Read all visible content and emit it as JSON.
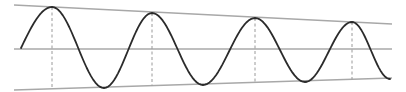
{
  "diagram": {
    "type": "damped-oscillation",
    "colors": {
      "background": "#ffffff",
      "wave": "#2b2b2b",
      "envelope": "#a8a8a8",
      "axis": "#a8a8a8",
      "peak_marker": "#9a9a9a"
    },
    "envelope_top": {
      "x1": 14,
      "y1": 5,
      "x2": 392,
      "y2": 24
    },
    "envelope_bottom": {
      "x1": 14,
      "y1": 90,
      "x2": 392,
      "y2": 78
    },
    "axis_line": {
      "x1": 14,
      "y1": 49,
      "x2": 392,
      "y2": 49
    },
    "peaks": [
      {
        "x": 52,
        "y": 7
      },
      {
        "x": 152,
        "y": 13
      },
      {
        "x": 255,
        "y": 18
      },
      {
        "x": 352,
        "y": 22
      }
    ],
    "troughs": [
      {
        "x": 104,
        "y": 88
      },
      {
        "x": 203,
        "y": 85
      },
      {
        "x": 305,
        "y": 82
      },
      {
        "x": 390,
        "y": 79
      }
    ],
    "wave_start": {
      "x": 21,
      "y": 48
    }
  }
}
